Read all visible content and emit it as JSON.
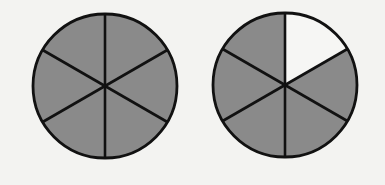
{
  "diagram": {
    "type": "fraction-circles",
    "background": "#f3f3f1",
    "stroke_color": "#111111",
    "shaded_color": "#8a8a8a",
    "unshaded_color": "#f6f6f4",
    "circles": [
      {
        "id": "whole",
        "cx": 105,
        "cy": 86,
        "r": 72,
        "parts": 6,
        "shaded": [
          true,
          true,
          true,
          true,
          true,
          true
        ],
        "shaded_count": 6
      },
      {
        "id": "five-sixths",
        "cx": 285,
        "cy": 85,
        "r": 72,
        "parts": 6,
        "shaded": [
          false,
          true,
          true,
          true,
          true,
          true
        ],
        "shaded_count": 5
      }
    ]
  }
}
